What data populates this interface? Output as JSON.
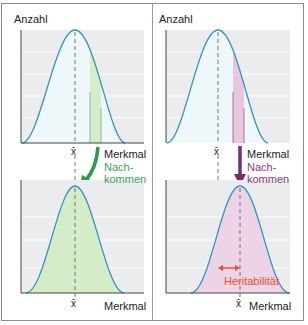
{
  "diagram": {
    "type": "selection-heritability-comparison",
    "panels": [
      {
        "id": "left",
        "y_axis_label": "Anzahl",
        "x_axis_label_top": "Merkmal",
        "x_axis_label_bottom": "Merkmal",
        "mean_symbol": "x̄",
        "arrow_label": "Nach-\nkommen",
        "arrow_label_line1": "Nach-",
        "arrow_label_line2": "kommen",
        "arrow_color": "#2e9a47",
        "label_color": "#3aa35a",
        "fill_color": "#d7efcf",
        "offspring_shift": "none"
      },
      {
        "id": "right",
        "y_axis_label": "Anzahl",
        "x_axis_label_top": "Merkmal",
        "x_axis_label_bottom": "Merkmal",
        "mean_symbol": "x̄",
        "arrow_label_line1": "Nach-",
        "arrow_label_line2": "kommen",
        "arrow_color": "#7a2d6e",
        "label_color": "#8a3a80",
        "fill_color": "#ecd3e6",
        "heritability_label": "Heritabilität",
        "heritability_color": "#e8502e",
        "offspring_shift": "toward selected group"
      }
    ],
    "colors": {
      "curve": "#3a8fc4",
      "plot_bg": "#ebecee",
      "gridline": "#f7f7f8",
      "axis": "#444444",
      "mean_line": "#555555"
    }
  },
  "labels": {
    "anzahl_left": "Anzahl",
    "anzahl_right": "Anzahl",
    "merkmal_tl": "Merkmal",
    "merkmal_tr": "Merkmal",
    "merkmal_bl": "Merkmal",
    "merkmal_br": "Merkmal",
    "xbar_tl": "x̄",
    "xbar_tr": "x̄",
    "xbar_bl": "x̄",
    "xbar_br": "x̄",
    "nach_left": "Nach-",
    "kommen_left": "kommen",
    "nach_right": "Nach-",
    "kommen_right": "kommen",
    "heritability": "Heritabilität"
  }
}
